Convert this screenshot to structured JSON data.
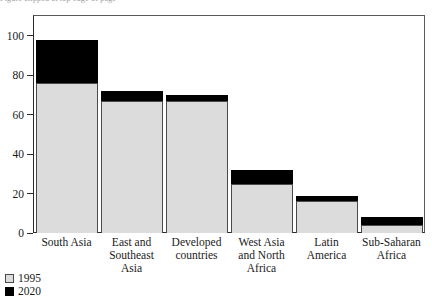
{
  "caption": {
    "clipped_text": "Figure clipped at top edge of page"
  },
  "legend": {
    "position": "bottom-left",
    "entries": [
      {
        "label": "1995",
        "color": "#dcdcdc",
        "swatch": "light-gray-square"
      },
      {
        "label": "2020",
        "color": "#000000",
        "swatch": "black-square"
      }
    ]
  },
  "chart_data": {
    "type": "bar",
    "stacked": true,
    "title": "",
    "xlabel": "",
    "ylabel": "",
    "ylim": [
      0,
      110
    ],
    "yticks": [
      0,
      20,
      40,
      60,
      80,
      100
    ],
    "ytick_labels": [
      "0",
      "20",
      "40",
      "60",
      "80",
      "100"
    ],
    "grid": false,
    "categories": [
      "South Asia",
      "East and Southeast Asia",
      "Developed countries",
      "West Asia and North Africa",
      "Latin America",
      "Sub-Saharan Africa"
    ],
    "series": [
      {
        "name": "1995",
        "color": "#dcdcdc",
        "values": [
          76,
          67,
          67,
          25,
          16,
          4
        ]
      },
      {
        "name": "2020",
        "color": "#000000",
        "values": [
          22,
          5,
          3,
          7,
          3,
          4
        ]
      }
    ],
    "totals": [
      98,
      72,
      70,
      32,
      19,
      8
    ]
  }
}
